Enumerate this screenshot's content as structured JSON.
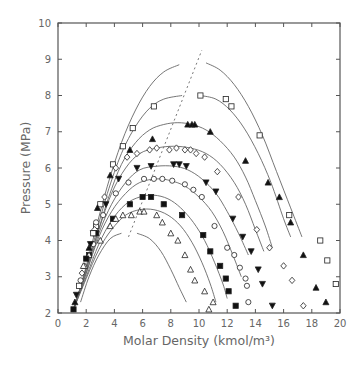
{
  "chart_data": {
    "type": "scatter",
    "title": "",
    "xlabel": "Molar Density (kmol/m³)",
    "ylabel": "Pressure (MPa)",
    "xlim": [
      0,
      20
    ],
    "ylim": [
      2,
      10
    ],
    "xticks": [
      0,
      2,
      4,
      6,
      8,
      10,
      12,
      14,
      16,
      18,
      20
    ],
    "yticks": [
      2,
      3,
      4,
      5,
      6,
      7,
      8,
      9,
      10
    ],
    "grid": false,
    "legend": "none",
    "dashed_line": [
      [
        5.0,
        4.1
      ],
      [
        10.2,
        9.25
      ]
    ],
    "curves": [
      {
        "name": "curve-1",
        "branches": [
          [
            [
              1.1,
              2.1
            ],
            [
              1.8,
              3.0
            ],
            [
              2.6,
              4.2
            ],
            [
              3.5,
              5.5
            ],
            [
              4.5,
              6.7
            ],
            [
              5.5,
              7.6
            ],
            [
              6.5,
              8.25
            ],
            [
              7.5,
              8.65
            ],
            [
              8.6,
              8.85
            ]
          ],
          [
            [
              10.5,
              8.9
            ],
            [
              11.5,
              8.7
            ],
            [
              12.5,
              8.3
            ],
            [
              13.5,
              7.7
            ],
            [
              14.5,
              6.9
            ],
            [
              15.5,
              5.9
            ],
            [
              16.5,
              4.9
            ],
            [
              17.3,
              4.1
            ]
          ]
        ]
      },
      {
        "name": "curve-2",
        "branches": [
          [
            [
              1.1,
              2.1
            ],
            [
              1.9,
              3.1
            ],
            [
              2.7,
              4.2
            ],
            [
              3.5,
              5.3
            ],
            [
              4.5,
              6.4
            ],
            [
              5.5,
              7.15
            ],
            [
              6.5,
              7.65
            ],
            [
              7.5,
              7.9
            ],
            [
              8.8,
              8.0
            ]
          ],
          [
            [
              10.1,
              8.0
            ],
            [
              11.2,
              7.9
            ],
            [
              12.2,
              7.6
            ],
            [
              13.2,
              7.1
            ],
            [
              14.2,
              6.4
            ],
            [
              15.1,
              5.6
            ],
            [
              16.0,
              4.6
            ],
            [
              16.5,
              4.1
            ]
          ]
        ]
      },
      {
        "name": "curve-3",
        "branches": [
          [
            [
              1.1,
              2.1
            ],
            [
              2.0,
              3.2
            ],
            [
              2.8,
              4.2
            ],
            [
              3.6,
              5.2
            ],
            [
              4.5,
              6.1
            ],
            [
              5.5,
              6.7
            ],
            [
              6.5,
              7.05
            ],
            [
              7.5,
              7.2
            ],
            [
              8.5,
              7.25
            ],
            [
              9.5,
              7.2
            ],
            [
              10.5,
              7.05
            ],
            [
              11.5,
              6.75
            ],
            [
              12.5,
              6.3
            ],
            [
              13.3,
              5.75
            ],
            [
              14.0,
              5.1
            ],
            [
              14.7,
              4.4
            ],
            [
              15.2,
              3.8
            ]
          ]
        ]
      },
      {
        "name": "curve-4",
        "branches": [
          [
            [
              1.1,
              2.1
            ],
            [
              2.0,
              3.2
            ],
            [
              2.9,
              4.3
            ],
            [
              3.8,
              5.3
            ],
            [
              4.8,
              6.0
            ],
            [
              5.8,
              6.4
            ],
            [
              7.0,
              6.55
            ],
            [
              8.2,
              6.6
            ],
            [
              9.4,
              6.55
            ],
            [
              10.5,
              6.4
            ],
            [
              11.5,
              6.1
            ],
            [
              12.5,
              5.6
            ],
            [
              13.3,
              5.0
            ],
            [
              14.0,
              4.3
            ],
            [
              14.6,
              3.7
            ]
          ]
        ]
      },
      {
        "name": "curve-5",
        "branches": [
          [
            [
              1.1,
              2.1
            ],
            [
              2.0,
              3.1
            ],
            [
              2.9,
              4.2
            ],
            [
              3.8,
              5.0
            ],
            [
              4.8,
              5.6
            ],
            [
              5.8,
              5.95
            ],
            [
              7.0,
              6.05
            ],
            [
              8.2,
              6.05
            ],
            [
              9.2,
              5.95
            ],
            [
              10.2,
              5.7
            ],
            [
              11.2,
              5.3
            ],
            [
              12.0,
              4.8
            ],
            [
              12.8,
              4.2
            ],
            [
              13.5,
              3.6
            ]
          ]
        ]
      },
      {
        "name": "curve-6",
        "branches": [
          [
            [
              1.1,
              2.1
            ],
            [
              2.0,
              3.1
            ],
            [
              2.9,
              4.1
            ],
            [
              3.8,
              4.8
            ],
            [
              4.8,
              5.3
            ],
            [
              5.8,
              5.6
            ],
            [
              7.0,
              5.7
            ],
            [
              8.0,
              5.65
            ],
            [
              9.0,
              5.5
            ],
            [
              10.0,
              5.2
            ],
            [
              10.9,
              4.8
            ],
            [
              11.7,
              4.25
            ],
            [
              12.4,
              3.6
            ],
            [
              13.0,
              3.0
            ]
          ]
        ]
      },
      {
        "name": "curve-7",
        "branches": [
          [
            [
              1.1,
              2.1
            ],
            [
              2.0,
              3.0
            ],
            [
              2.9,
              3.9
            ],
            [
              3.8,
              4.55
            ],
            [
              4.8,
              5.0
            ],
            [
              5.8,
              5.2
            ],
            [
              6.8,
              5.25
            ],
            [
              7.8,
              5.15
            ],
            [
              8.7,
              4.9
            ],
            [
              9.6,
              4.5
            ],
            [
              10.4,
              4.0
            ],
            [
              11.1,
              3.4
            ],
            [
              11.7,
              2.8
            ],
            [
              12.0,
              2.4
            ]
          ]
        ]
      },
      {
        "name": "curve-8",
        "branches": [
          [
            [
              1.1,
              2.1
            ],
            [
              2.0,
              2.95
            ],
            [
              2.9,
              3.75
            ],
            [
              3.8,
              4.3
            ],
            [
              4.8,
              4.7
            ],
            [
              5.8,
              4.85
            ],
            [
              6.8,
              4.85
            ],
            [
              7.8,
              4.7
            ],
            [
              8.7,
              4.4
            ],
            [
              9.5,
              3.95
            ],
            [
              10.2,
              3.4
            ],
            [
              10.8,
              2.8
            ],
            [
              11.2,
              2.3
            ]
          ]
        ]
      },
      {
        "name": "curve-9",
        "branches": [
          [
            [
              1.6,
              2.3
            ],
            [
              2.2,
              3.0
            ],
            [
              2.9,
              3.6
            ],
            [
              3.7,
              4.05
            ],
            [
              4.5,
              4.2
            ]
          ],
          [
            [
              5.6,
              4.2
            ],
            [
              6.5,
              4.05
            ],
            [
              7.3,
              3.7
            ],
            [
              8.0,
              3.2
            ],
            [
              8.6,
              2.7
            ],
            [
              9.1,
              2.3
            ]
          ]
        ]
      }
    ],
    "series": [
      {
        "name": "open-square",
        "marker": "square-open",
        "points": [
          [
            2.7,
            4.4
          ],
          [
            3.0,
            5.0
          ],
          [
            3.9,
            6.1
          ],
          [
            4.6,
            6.6
          ],
          [
            5.3,
            7.1
          ],
          [
            6.8,
            7.7
          ],
          [
            10.1,
            8.0
          ],
          [
            11.9,
            7.9
          ],
          [
            12.3,
            7.7
          ],
          [
            14.3,
            6.9
          ],
          [
            16.4,
            4.7
          ],
          [
            18.6,
            4.0
          ],
          [
            19.1,
            3.45
          ],
          [
            19.7,
            2.8
          ]
        ]
      },
      {
        "name": "filled-triangle-up",
        "marker": "triangle-up-filled",
        "points": [
          [
            2.8,
            4.9
          ],
          [
            3.7,
            5.8
          ],
          [
            5.1,
            6.5
          ],
          [
            6.7,
            6.8
          ],
          [
            9.2,
            7.2
          ],
          [
            9.5,
            7.2
          ],
          [
            9.7,
            7.2
          ],
          [
            10.8,
            7.0
          ],
          [
            13.3,
            6.2
          ],
          [
            14.9,
            5.6
          ],
          [
            15.7,
            5.2
          ],
          [
            16.5,
            4.5
          ],
          [
            17.4,
            3.6
          ],
          [
            18.3,
            2.7
          ],
          [
            19.0,
            2.3
          ]
        ]
      },
      {
        "name": "open-diamond",
        "marker": "diamond-open",
        "points": [
          [
            2.6,
            4.3
          ],
          [
            3.3,
            5.2
          ],
          [
            4.1,
            6.0
          ],
          [
            4.9,
            6.3
          ],
          [
            5.6,
            6.4
          ],
          [
            6.5,
            6.5
          ],
          [
            7.0,
            6.55
          ],
          [
            7.9,
            6.5
          ],
          [
            8.4,
            6.55
          ],
          [
            9.0,
            6.5
          ],
          [
            9.4,
            6.5
          ],
          [
            9.8,
            6.4
          ],
          [
            10.4,
            6.3
          ],
          [
            11.3,
            5.9
          ],
          [
            12.8,
            5.2
          ],
          [
            14.1,
            4.3
          ],
          [
            15.0,
            3.8
          ],
          [
            16.0,
            3.3
          ],
          [
            16.6,
            2.9
          ],
          [
            17.4,
            2.2
          ]
        ]
      },
      {
        "name": "filled-triangle-down",
        "marker": "triangle-down-filled",
        "points": [
          [
            2.5,
            4.2
          ],
          [
            3.4,
            5.0
          ],
          [
            4.3,
            5.7
          ],
          [
            5.6,
            6.0
          ],
          [
            6.6,
            6.05
          ],
          [
            8.2,
            6.1
          ],
          [
            8.6,
            6.1
          ],
          [
            9.1,
            6.05
          ],
          [
            10.5,
            5.6
          ],
          [
            11.2,
            5.35
          ],
          [
            12.4,
            4.6
          ],
          [
            13.1,
            4.1
          ],
          [
            13.7,
            3.7
          ],
          [
            14.2,
            3.2
          ],
          [
            14.5,
            2.8
          ],
          [
            15.2,
            2.2
          ]
        ]
      },
      {
        "name": "open-circle",
        "marker": "circle-open",
        "points": [
          [
            2.5,
            3.9
          ],
          [
            3.2,
            4.7
          ],
          [
            4.1,
            5.3
          ],
          [
            5.0,
            5.6
          ],
          [
            6.1,
            5.7
          ],
          [
            6.8,
            5.7
          ],
          [
            7.4,
            5.7
          ],
          [
            8.1,
            5.65
          ],
          [
            9.0,
            5.55
          ],
          [
            9.6,
            5.4
          ],
          [
            10.2,
            5.2
          ],
          [
            11.1,
            4.4
          ],
          [
            12.0,
            3.8
          ],
          [
            12.9,
            3.25
          ],
          [
            13.4,
            2.75
          ],
          [
            13.5,
            2.3
          ],
          [
            13.3,
            2.95
          ],
          [
            12.5,
            3.6
          ]
        ]
      },
      {
        "name": "filled-square",
        "marker": "square-filled",
        "points": [
          [
            2.2,
            3.6
          ],
          [
            2.7,
            4.2
          ],
          [
            3.9,
            4.6
          ],
          [
            5.1,
            5.0
          ],
          [
            6.0,
            5.2
          ],
          [
            6.6,
            5.2
          ],
          [
            7.5,
            5.0
          ],
          [
            8.8,
            4.7
          ],
          [
            10.3,
            4.15
          ],
          [
            10.8,
            3.7
          ],
          [
            11.5,
            3.3
          ],
          [
            11.9,
            2.95
          ],
          [
            12.1,
            2.6
          ],
          [
            12.6,
            2.2
          ]
        ]
      },
      {
        "name": "open-triangle-up",
        "marker": "triangle-up-open",
        "points": [
          [
            1.9,
            3.3
          ],
          [
            2.2,
            3.6
          ],
          [
            3.0,
            4.0
          ],
          [
            3.7,
            4.4
          ],
          [
            4.1,
            4.6
          ],
          [
            4.6,
            4.7
          ],
          [
            5.2,
            4.7
          ],
          [
            5.8,
            4.8
          ],
          [
            6.1,
            4.8
          ],
          [
            7.0,
            4.7
          ],
          [
            7.4,
            4.5
          ],
          [
            8.0,
            4.2
          ],
          [
            8.5,
            4.0
          ],
          [
            9.0,
            3.6
          ],
          [
            9.4,
            3.2
          ],
          [
            9.7,
            2.9
          ],
          [
            10.4,
            2.6
          ],
          [
            11.0,
            2.3
          ],
          [
            10.7,
            2.1
          ]
        ]
      },
      {
        "name": "dense-cluster",
        "marker": "mixed",
        "points": [
          [
            1.1,
            2.1
          ],
          [
            1.2,
            2.3
          ],
          [
            1.3,
            2.5
          ],
          [
            1.5,
            2.75
          ],
          [
            1.6,
            2.9
          ],
          [
            1.7,
            3.1
          ],
          [
            1.8,
            3.3
          ],
          [
            2.0,
            3.5
          ],
          [
            2.2,
            3.8
          ],
          [
            2.3,
            3.9
          ],
          [
            2.5,
            4.2
          ],
          [
            2.7,
            4.5
          ]
        ]
      }
    ]
  }
}
